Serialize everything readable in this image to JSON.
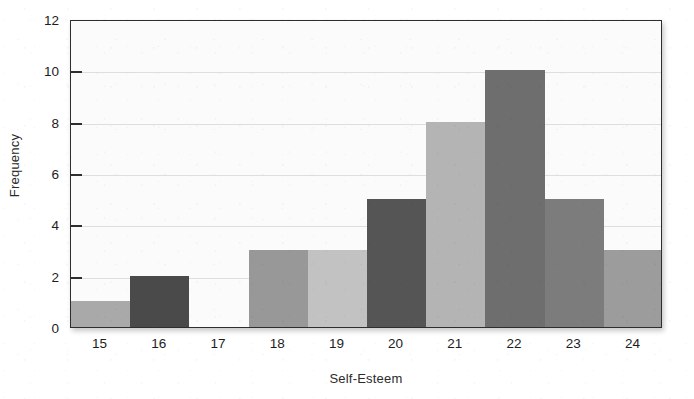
{
  "chart_data": {
    "type": "bar",
    "title": "",
    "subtitle": "",
    "xlabel": "Self-Esteem",
    "ylabel": "Frequency",
    "categories": [
      "15",
      "16",
      "17",
      "18",
      "19",
      "20",
      "21",
      "22",
      "23",
      "24"
    ],
    "values": [
      1,
      2,
      0,
      3,
      3,
      5,
      8,
      10,
      5,
      3
    ],
    "bar_colors": [
      "#a9a9a9",
      "#4a4a4a",
      "#ffffff",
      "#989898",
      "#c2c2c2",
      "#555555",
      "#b4b4b4",
      "#6e6e6e",
      "#7c7c7c",
      "#9c9c9c"
    ],
    "xlim": [
      15,
      25
    ],
    "ylim": [
      0,
      12
    ],
    "y_ticks": [
      0,
      2,
      4,
      6,
      8,
      10,
      12
    ],
    "y_tick_labels": [
      "0",
      "2",
      "4",
      "6",
      "8",
      "10",
      "12"
    ],
    "x_tick_labels": [
      "15",
      "16",
      "17",
      "18",
      "19",
      "20",
      "21",
      "22",
      "23",
      "24"
    ],
    "grid": true,
    "grid_axis": "y",
    "legend": false,
    "legend_position": "none",
    "bar_gap": 0,
    "plot_background": "#fbfbfb",
    "grid_color": "#dedede",
    "axis_color": "#2e2e2e",
    "text_color": "#1d1d1d"
  }
}
